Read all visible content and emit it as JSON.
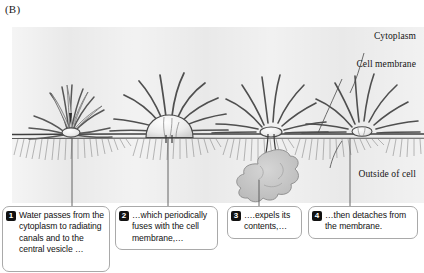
{
  "panel": {
    "label": "(B)"
  },
  "figure_annotations": {
    "cytoplasm": "Cytoplasm",
    "cell_membrane": "Cell membrane",
    "outside_of_cell": "Outside of cell"
  },
  "callouts": [
    {
      "number": "1",
      "text": "Water passes from the cytoplasm to radiating canals and to the central vesicle …"
    },
    {
      "number": "2",
      "text": "…which periodically fuses with the cell membrane,…"
    },
    {
      "number": "3",
      "text": "….expels its contents,…"
    },
    {
      "number": "4",
      "text": "…then detaches from the membrane."
    }
  ],
  "colors": {
    "panel_background": "#e8e8e8",
    "membrane_line": "#4a4a4a",
    "vesicle_fill": "#ececec",
    "canal_stroke": "#555555",
    "expelled_contents": "#c7c7c7",
    "badge_background": "#111111",
    "callout_border": "#a9a9a9"
  }
}
